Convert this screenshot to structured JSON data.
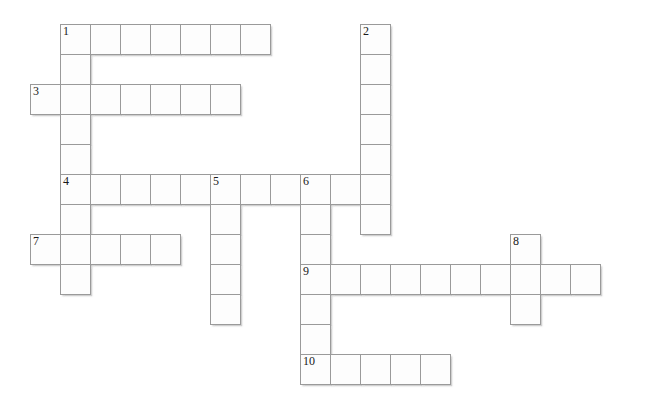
{
  "puzzle": {
    "title": "Crossword Grid",
    "cell_size": 30,
    "grid_origin_x": 30,
    "grid_origin_y": 24,
    "colors": {
      "cell_fill": "#fdfdfd",
      "cell_border": "#9a9a9a",
      "number_text": "#1a1a1a",
      "page_background": "#ffffff"
    },
    "entries": [
      {
        "number": "1",
        "direction": "across",
        "col": 1,
        "row": 0,
        "length": 7
      },
      {
        "number": "1",
        "direction": "down",
        "col": 1,
        "row": 0,
        "length": 9
      },
      {
        "number": "2",
        "direction": "down",
        "col": 11,
        "row": 0,
        "length": 8
      },
      {
        "number": "3",
        "direction": "across",
        "col": 0,
        "row": 2,
        "length": 7
      },
      {
        "number": "4",
        "direction": "across",
        "col": 1,
        "row": 5,
        "length": 11
      },
      {
        "number": "5",
        "direction": "down",
        "col": 6,
        "row": 5,
        "length": 5
      },
      {
        "number": "6",
        "direction": "down",
        "col": 9,
        "row": 5,
        "length": 7
      },
      {
        "number": "7",
        "direction": "across",
        "col": 0,
        "row": 7,
        "length": 5
      },
      {
        "number": "8",
        "direction": "down",
        "col": 16,
        "row": 7,
        "length": 3
      },
      {
        "number": "9",
        "direction": "across",
        "col": 9,
        "row": 8,
        "length": 10
      },
      {
        "number": "10",
        "direction": "across",
        "col": 9,
        "row": 11,
        "length": 5
      }
    ],
    "cells": [
      {
        "col": 1,
        "row": 0,
        "number": "1"
      },
      {
        "col": 2,
        "row": 0,
        "number": ""
      },
      {
        "col": 3,
        "row": 0,
        "number": ""
      },
      {
        "col": 4,
        "row": 0,
        "number": ""
      },
      {
        "col": 5,
        "row": 0,
        "number": ""
      },
      {
        "col": 6,
        "row": 0,
        "number": ""
      },
      {
        "col": 7,
        "row": 0,
        "number": ""
      },
      {
        "col": 11,
        "row": 0,
        "number": "2"
      },
      {
        "col": 11,
        "row": 1,
        "number": ""
      },
      {
        "col": 1,
        "row": 1,
        "number": ""
      },
      {
        "col": 0,
        "row": 2,
        "number": "3"
      },
      {
        "col": 1,
        "row": 2,
        "number": ""
      },
      {
        "col": 2,
        "row": 2,
        "number": ""
      },
      {
        "col": 3,
        "row": 2,
        "number": ""
      },
      {
        "col": 4,
        "row": 2,
        "number": ""
      },
      {
        "col": 5,
        "row": 2,
        "number": ""
      },
      {
        "col": 6,
        "row": 2,
        "number": ""
      },
      {
        "col": 11,
        "row": 2,
        "number": ""
      },
      {
        "col": 1,
        "row": 3,
        "number": ""
      },
      {
        "col": 11,
        "row": 3,
        "number": ""
      },
      {
        "col": 1,
        "row": 4,
        "number": ""
      },
      {
        "col": 11,
        "row": 4,
        "number": ""
      },
      {
        "col": 1,
        "row": 5,
        "number": "4"
      },
      {
        "col": 2,
        "row": 5,
        "number": ""
      },
      {
        "col": 3,
        "row": 5,
        "number": ""
      },
      {
        "col": 4,
        "row": 5,
        "number": ""
      },
      {
        "col": 5,
        "row": 5,
        "number": ""
      },
      {
        "col": 6,
        "row": 5,
        "number": "5"
      },
      {
        "col": 7,
        "row": 5,
        "number": ""
      },
      {
        "col": 8,
        "row": 5,
        "number": ""
      },
      {
        "col": 9,
        "row": 5,
        "number": "6"
      },
      {
        "col": 10,
        "row": 5,
        "number": ""
      },
      {
        "col": 11,
        "row": 5,
        "number": ""
      },
      {
        "col": 1,
        "row": 6,
        "number": ""
      },
      {
        "col": 6,
        "row": 6,
        "number": ""
      },
      {
        "col": 9,
        "row": 6,
        "number": ""
      },
      {
        "col": 11,
        "row": 6,
        "number": ""
      },
      {
        "col": 0,
        "row": 7,
        "number": "7"
      },
      {
        "col": 1,
        "row": 7,
        "number": ""
      },
      {
        "col": 2,
        "row": 7,
        "number": ""
      },
      {
        "col": 3,
        "row": 7,
        "number": ""
      },
      {
        "col": 4,
        "row": 7,
        "number": ""
      },
      {
        "col": 6,
        "row": 7,
        "number": ""
      },
      {
        "col": 9,
        "row": 7,
        "number": ""
      },
      {
        "col": 16,
        "row": 7,
        "number": "8"
      },
      {
        "col": 9,
        "row": 8,
        "number": "9"
      },
      {
        "col": 10,
        "row": 8,
        "number": ""
      },
      {
        "col": 11,
        "row": 8,
        "number": ""
      },
      {
        "col": 12,
        "row": 8,
        "number": ""
      },
      {
        "col": 13,
        "row": 8,
        "number": ""
      },
      {
        "col": 14,
        "row": 8,
        "number": ""
      },
      {
        "col": 15,
        "row": 8,
        "number": ""
      },
      {
        "col": 16,
        "row": 8,
        "number": ""
      },
      {
        "col": 17,
        "row": 8,
        "number": ""
      },
      {
        "col": 18,
        "row": 8,
        "number": ""
      },
      {
        "col": 1,
        "row": 8,
        "number": ""
      },
      {
        "col": 6,
        "row": 8,
        "number": ""
      },
      {
        "col": 6,
        "row": 9,
        "number": ""
      },
      {
        "col": 9,
        "row": 9,
        "number": ""
      },
      {
        "col": 16,
        "row": 9,
        "number": ""
      },
      {
        "col": 9,
        "row": 10,
        "number": ""
      },
      {
        "col": 9,
        "row": 11,
        "number": "10"
      },
      {
        "col": 10,
        "row": 11,
        "number": ""
      },
      {
        "col": 11,
        "row": 11,
        "number": ""
      },
      {
        "col": 12,
        "row": 11,
        "number": ""
      },
      {
        "col": 13,
        "row": 11,
        "number": ""
      }
    ]
  }
}
